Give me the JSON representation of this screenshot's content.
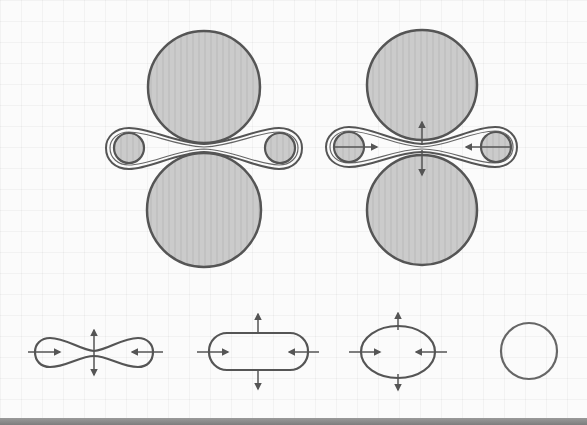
{
  "diagram": {
    "colors": {
      "stroke": "#555555",
      "roll_fill": "#c9c9c9",
      "bar_fill": "#cfcfcf",
      "background": "#fbfbfb"
    },
    "panels": [
      {
        "id": "rolling-without-forces",
        "description": "Two rolls compressing a bar loop between them"
      },
      {
        "id": "rolling-with-forces",
        "description": "Two rolls compressing a bar loop with force arrows"
      }
    ],
    "stages": [
      {
        "id": "stage-1",
        "shape": "dog-bone",
        "arrows": [
          "inward-left",
          "inward-right",
          "up",
          "down"
        ]
      },
      {
        "id": "stage-2",
        "shape": "stadium",
        "arrows": [
          "inward-left",
          "inward-right",
          "up",
          "down"
        ]
      },
      {
        "id": "stage-3",
        "shape": "ellipse",
        "arrows": [
          "inward-left",
          "inward-right",
          "up",
          "down"
        ]
      },
      {
        "id": "stage-4",
        "shape": "circle",
        "arrows": []
      }
    ]
  }
}
